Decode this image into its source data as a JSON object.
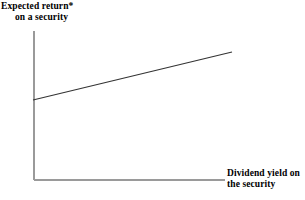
{
  "figure": {
    "width": 305,
    "height": 200,
    "background_color": "#ffffff"
  },
  "chart_data": {
    "type": "line",
    "title": "",
    "subtitle": "",
    "ylabel_line_1": "Expected return*",
    "ylabel_line_2": "on a security",
    "xlabel_line_1": "Dividend yield on",
    "xlabel_line_2": "the security",
    "xlabel": "Dividend yield on the security",
    "ylabel": "Expected return* on a security",
    "grid": false,
    "legend": false,
    "legend_position": "none",
    "axis_ticks": false,
    "tick_labels_x": [],
    "tick_labels_y": [],
    "xlim": [
      0,
      1
    ],
    "ylim": [
      0,
      1
    ],
    "annotations": [
      "*"
    ],
    "series": [
      {
        "name": "Expected return vs dividend yield",
        "x": [
          0.0,
          1.0
        ],
        "y": [
          0.537,
          0.859
        ],
        "description": "Upward sloping straight line with positive intercept",
        "color": "#333333",
        "line_width": 1.1
      }
    ],
    "axis_color": "#9a9a9a",
    "text_color": "#000000"
  },
  "geometry": {
    "axis_origin_x": 34,
    "axis_origin_y": 180,
    "y_axis_top": 31,
    "x_axis_right": 225,
    "line_start_x": 33,
    "line_start_y": 100,
    "line_end_x": 232,
    "line_end_y": 52
  }
}
